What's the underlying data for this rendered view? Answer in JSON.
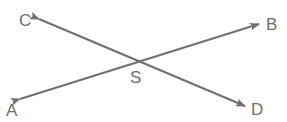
{
  "diagram": {
    "title": "",
    "line_color": "#707070",
    "label_color": "#6e6e6e",
    "points": {
      "A": {
        "label": "A"
      },
      "B": {
        "label": "B"
      },
      "C": {
        "label": "C"
      },
      "D": {
        "label": "D"
      },
      "S": {
        "label": "S"
      }
    },
    "lines": [
      {
        "name": "line-AB",
        "from": "A",
        "to": "B",
        "arrows": "both"
      },
      {
        "name": "line-CD",
        "from": "C",
        "to": "D",
        "arrows": "both"
      }
    ],
    "intersection": "S"
  }
}
